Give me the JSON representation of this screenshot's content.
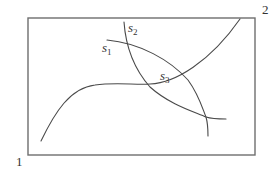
{
  "diagram": {
    "type": "curves-in-rectangle",
    "colors": {
      "background": "#ffffff",
      "frame": "#6e6e6e",
      "curves": "#4a4a4a",
      "text": "#333333"
    },
    "frame": {
      "x": 28,
      "y": 18,
      "width": 227,
      "height": 137
    },
    "corner_labels": {
      "bottom_left": "1",
      "top_right": "2"
    },
    "curves": [
      {
        "id": "cubic",
        "description": "S-shaped curve rising from lower-left, flattening in the middle, then rising to the top edge",
        "path": "M41,141 C55,112 70,88 95,85 C115,82 135,85 150,84 C175,83 210,62 240,19"
      },
      {
        "id": "s1",
        "label": "s",
        "subscript": "1",
        "path": "M107,40 C140,43 170,60 188,80 C199,95 203,110 206,117 C212,119 220,119 226,119"
      },
      {
        "id": "s2",
        "label": "s",
        "subscript": "2",
        "path": "M124,22 C126,50 135,70 150,87 C170,105 195,112 206,117 C208,124 208,130 208,136"
      }
    ],
    "curve_labels": [
      {
        "id": "s1",
        "base": "s",
        "sub": "1",
        "x": 102,
        "y": 52
      },
      {
        "id": "s2",
        "base": "s",
        "sub": "2",
        "x": 128,
        "y": 32
      },
      {
        "id": "s3",
        "base": "s",
        "sub": "3",
        "x": 160,
        "y": 80
      }
    ],
    "intersections": [
      {
        "between": [
          "s1",
          "s2"
        ],
        "x": 126,
        "y": 42
      },
      {
        "between": [
          "cubic",
          "s2"
        ],
        "x": 148,
        "y": 85
      },
      {
        "between": [
          "cubic",
          "s1"
        ],
        "x": 184,
        "y": 77
      },
      {
        "between": [
          "s1",
          "s2"
        ],
        "x": 206,
        "y": 117
      }
    ]
  }
}
